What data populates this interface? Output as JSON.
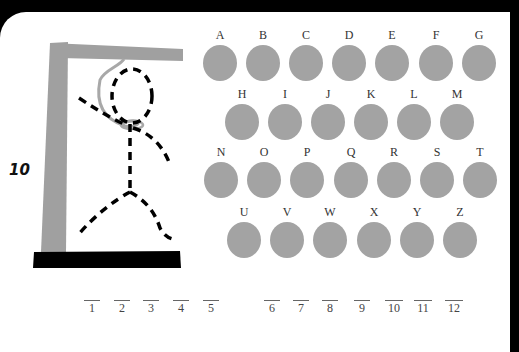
{
  "game": {
    "title": "Hangman",
    "score": "10",
    "colors": {
      "letter_button": "#a3a3a3",
      "gallows": "#a0a0a0",
      "base": "#000000",
      "figure": "#000000",
      "rope": "#a8a8a8"
    }
  },
  "letters": {
    "row1": [
      {
        "label": "A",
        "x": 203,
        "y": 45
      },
      {
        "label": "B",
        "x": 246,
        "y": 45
      },
      {
        "label": "C",
        "x": 289,
        "y": 45
      },
      {
        "label": "D",
        "x": 332,
        "y": 45
      },
      {
        "label": "E",
        "x": 375,
        "y": 45
      },
      {
        "label": "F",
        "x": 419,
        "y": 45
      },
      {
        "label": "G",
        "x": 462,
        "y": 45
      }
    ],
    "row2": [
      {
        "label": "H",
        "x": 225,
        "y": 104
      },
      {
        "label": "I",
        "x": 268,
        "y": 104
      },
      {
        "label": "J",
        "x": 311,
        "y": 104
      },
      {
        "label": "K",
        "x": 354,
        "y": 104
      },
      {
        "label": "L",
        "x": 397,
        "y": 104
      },
      {
        "label": "M",
        "x": 440,
        "y": 104
      }
    ],
    "row3": [
      {
        "label": "N",
        "x": 204,
        "y": 162
      },
      {
        "label": "O",
        "x": 247,
        "y": 162
      },
      {
        "label": "P",
        "x": 290,
        "y": 162
      },
      {
        "label": "Q",
        "x": 334,
        "y": 162
      },
      {
        "label": "R",
        "x": 377,
        "y": 162
      },
      {
        "label": "S",
        "x": 420,
        "y": 162
      },
      {
        "label": "T",
        "x": 463,
        "y": 162
      }
    ],
    "row4": [
      {
        "label": "U",
        "x": 227,
        "y": 222
      },
      {
        "label": "V",
        "x": 270,
        "y": 222
      },
      {
        "label": "W",
        "x": 313,
        "y": 222
      },
      {
        "label": "X",
        "x": 357,
        "y": 222
      },
      {
        "label": "Y",
        "x": 400,
        "y": 222
      },
      {
        "label": "Z",
        "x": 443,
        "y": 222
      }
    ]
  },
  "blanks": [
    {
      "label": "1",
      "x": 84
    },
    {
      "label": "2",
      "x": 114
    },
    {
      "label": "3",
      "x": 143
    },
    {
      "label": "4",
      "x": 173
    },
    {
      "label": "5",
      "x": 203
    },
    {
      "label": "6",
      "x": 264
    },
    {
      "label": "7",
      "x": 293
    },
    {
      "label": "8",
      "x": 322
    },
    {
      "label": "9",
      "x": 354
    },
    {
      "label": "10",
      "x": 385
    },
    {
      "label": "11",
      "x": 414
    },
    {
      "label": "12",
      "x": 445
    }
  ]
}
